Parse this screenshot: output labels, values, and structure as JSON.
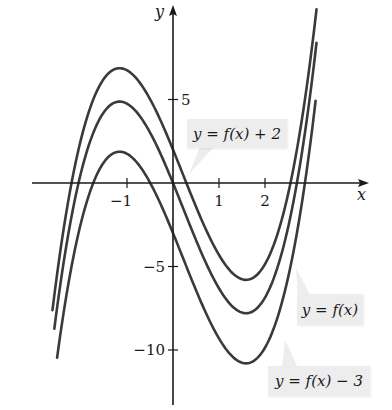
{
  "chart_data": {
    "type": "line",
    "title": "",
    "xlabel": "x",
    "ylabel": "y",
    "x_ticks": [
      {
        "value": -1,
        "label": "−1"
      },
      {
        "value": 1,
        "label": "1"
      },
      {
        "value": 2,
        "label": "2"
      }
    ],
    "y_ticks": [
      {
        "value": 5,
        "label": "5"
      },
      {
        "value": -5,
        "label": "−5"
      },
      {
        "value": -10,
        "label": "−10"
      }
    ],
    "xlim": [
      -3.0,
      4.3
    ],
    "ylim": [
      -12,
      11
    ],
    "grid": false,
    "legend": "callouts",
    "base_function": {
      "form": "cubic a*x^3 + b*x^2 + c*x + d",
      "a": 1.22,
      "b": -0.78,
      "c": -6.75,
      "d": 0,
      "local_max": {
        "x": -1.15,
        "y": 5
      },
      "local_min": {
        "x": 1.6,
        "y": -7.8
      }
    },
    "series": [
      {
        "name": "y = f(x) + 2",
        "shift": 2,
        "x_range": [
          -2.62,
          3.12
        ],
        "points": [
          [
            -2.5,
            -5.4
          ],
          [
            -2,
            3.1
          ],
          [
            -1.15,
            7
          ],
          [
            0,
            2
          ],
          [
            1,
            -4.3
          ],
          [
            1.6,
            -5.8
          ],
          [
            2.5,
            -1.6
          ],
          [
            3,
            4.6
          ]
        ]
      },
      {
        "name": "y = f(x)",
        "shift": 0,
        "x_range": [
          -2.58,
          3.12
        ],
        "points": [
          [
            -2.5,
            -7.4
          ],
          [
            -2,
            1.1
          ],
          [
            -1.15,
            5
          ],
          [
            0,
            0
          ],
          [
            1,
            -6.3
          ],
          [
            1.6,
            -7.8
          ],
          [
            2.5,
            -3.6
          ],
          [
            3,
            2.6
          ]
        ]
      },
      {
        "name": "y = f(x) − 3",
        "shift": -3,
        "x_range": [
          -2.52,
          3.1
        ],
        "points": [
          [
            -2.5,
            -10.4
          ],
          [
            -2,
            -1.9
          ],
          [
            -1.15,
            2
          ],
          [
            0,
            -3
          ],
          [
            1,
            -9.3
          ],
          [
            1.6,
            -10.8
          ],
          [
            2.5,
            -6.6
          ],
          [
            3,
            -0.4
          ]
        ]
      }
    ],
    "annotations": [
      {
        "text": "y = f(x) + 2",
        "target_series": 0
      },
      {
        "text": "y = f(x)",
        "target_series": 1
      },
      {
        "text": "y = f(x) − 3",
        "target_series": 2
      }
    ]
  },
  "labels": {
    "x_axis": "x",
    "y_axis": "y",
    "callout_top": "y = f(x) + 2",
    "callout_mid": "y = f(x)",
    "callout_bottom": "y = f(x) − 3"
  },
  "style": {
    "curve_color": "#3a3a3a",
    "axis_color": "#1a1a1a",
    "callout_bg": "#ededed"
  }
}
